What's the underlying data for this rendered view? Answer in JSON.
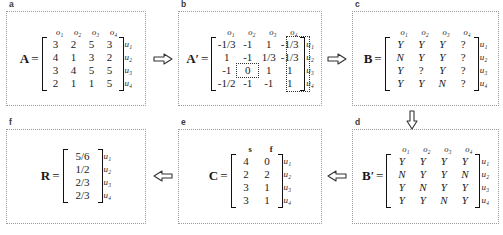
{
  "figure": {
    "col_headers_o": [
      "o₁",
      "o₂",
      "o₃",
      "o₄"
    ],
    "row_labels_u": [
      "u₁",
      "u₂",
      "u₃",
      "u₄"
    ]
  },
  "panels": {
    "a": {
      "label": "a",
      "matrix_name": "A",
      "equals": "=",
      "col_headers": [
        "o₁",
        "o₂",
        "o₃",
        "o₄"
      ],
      "row_labels": [
        "u₁",
        "u₂",
        "u₃",
        "u₄"
      ],
      "rows": [
        [
          "3",
          "2",
          "5",
          "3"
        ],
        [
          "4",
          "1",
          "3",
          "2"
        ],
        [
          "3",
          "4",
          "5",
          "5"
        ],
        [
          "2",
          "1",
          "1",
          "5"
        ]
      ]
    },
    "b": {
      "label": "b",
      "matrix_name": "A",
      "prime": "′",
      "equals": "=",
      "col_headers": [
        "o₁",
        "o₂",
        "o₃",
        "o₄"
      ],
      "row_labels": [
        "u₁",
        "u₂",
        "u₃",
        "u₄"
      ],
      "rows": [
        [
          "-1/3",
          "-1",
          "1",
          "-1/3"
        ],
        [
          "1",
          "-1",
          "1/3",
          "-1/3"
        ],
        [
          "-1",
          "0",
          "1",
          "1"
        ],
        [
          "-1/2",
          "-1",
          "-1",
          "1"
        ]
      ],
      "highlight_cell": {
        "row": 2,
        "col": 1
      },
      "highlight_column": 3
    },
    "c": {
      "label": "c",
      "matrix_name": "B",
      "equals": "=",
      "col_headers": [
        "o₁",
        "o₂",
        "o₃",
        "o₄"
      ],
      "row_labels": [
        "u₁",
        "u₂",
        "u₃",
        "u₄"
      ],
      "rows": [
        [
          "Y",
          "Y",
          "Y",
          "?"
        ],
        [
          "N",
          "Y",
          "Y",
          "?"
        ],
        [
          "Y",
          "?",
          "Y",
          "?"
        ],
        [
          "Y",
          "Y",
          "N",
          "?"
        ]
      ]
    },
    "d": {
      "label": "d",
      "matrix_name": "B",
      "prime": "′",
      "equals": "=",
      "col_headers": [
        "o₁",
        "o₂",
        "o₃",
        "o₄"
      ],
      "row_labels": [
        "u₁",
        "u₂",
        "u₃",
        "u₄"
      ],
      "rows": [
        [
          "Y",
          "Y",
          "Y",
          "Y"
        ],
        [
          "N",
          "Y",
          "Y",
          "N"
        ],
        [
          "Y",
          "N",
          "Y",
          "Y"
        ],
        [
          "Y",
          "Y",
          "N",
          "Y"
        ]
      ]
    },
    "e": {
      "label": "e",
      "matrix_name": "C",
      "equals": "=",
      "col_headers": [
        "s",
        "f"
      ],
      "row_labels": [
        "u₁",
        "u₂",
        "u₃",
        "u₄"
      ],
      "rows": [
        [
          "4",
          "0"
        ],
        [
          "2",
          "2"
        ],
        [
          "3",
          "1"
        ],
        [
          "3",
          "1"
        ]
      ]
    },
    "f": {
      "label": "f",
      "matrix_name": "R",
      "equals": "=",
      "col_headers": [],
      "row_labels": [
        "u₁",
        "u₂",
        "u₃",
        "u₄"
      ],
      "rows": [
        [
          "5/6"
        ],
        [
          "1/2"
        ],
        [
          "2/3"
        ],
        [
          "2/3"
        ]
      ]
    }
  },
  "arrows": {
    "a_to_b": "arrow-right",
    "b_to_c": "arrow-right",
    "c_to_d": "arrow-down",
    "d_to_e": "arrow-left",
    "e_to_f": "arrow-left"
  }
}
